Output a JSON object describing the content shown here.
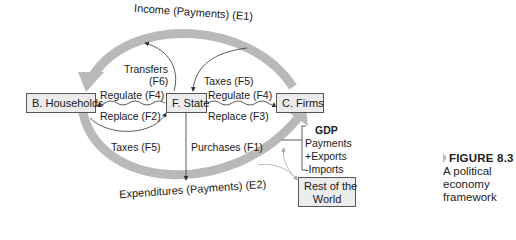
{
  "nodes": {
    "households": "B. Households",
    "state": "F. State",
    "firms": "C. Firms",
    "rest_of_world_line1": "Rest of the",
    "rest_of_world_line2": "World"
  },
  "flows": {
    "income": "Income (Payments) (E1)",
    "expenditures": "Expenditures (Payments) (E2)",
    "transfers_line1": "Transfers",
    "transfers_line2": "(F6)",
    "taxes_firms": "Taxes (F5)",
    "regulate_households": "Regulate (F4)",
    "replace_households": "Replace (F2)",
    "regulate_firms": "Regulate (F4)",
    "replace_firms": "Replace (F3)",
    "taxes_households": "Taxes (F5)",
    "purchases": "Purchases (F1)"
  },
  "gdp": {
    "title": "GDP",
    "line1": "Payments",
    "line2": "+Exports",
    "line3": "-Imports"
  },
  "caption": {
    "figure": "FIGURE 8.3",
    "line1": "A political",
    "line2": "economy",
    "line3": "framework"
  },
  "colors": {
    "circuit_arrow": "#b9b9b9",
    "box_fill": "#ececec",
    "line": "#333333"
  }
}
